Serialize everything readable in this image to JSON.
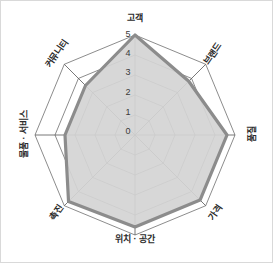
{
  "chart_data": {
    "type": "radar",
    "title": "",
    "subtitle": "",
    "xlabel": "",
    "ylabel": "",
    "categories": [
      "고객",
      "브랜드",
      "품질",
      "가격",
      "위치 · 공간",
      "촉진",
      "물품 · 서비스",
      "커뮤니티"
    ],
    "series": [
      {
        "name": "",
        "values": [
          5.0,
          3.8,
          4.6,
          4.6,
          4.6,
          4.7,
          3.5,
          3.5
        ]
      }
    ],
    "rlim": [
      0,
      5
    ],
    "tick_values": [
      0,
      1,
      2,
      3,
      4,
      5
    ],
    "tick_labels": [
      "0",
      "1",
      "2",
      "3",
      "4",
      "5"
    ],
    "grid": true,
    "grid_shape": "polygon",
    "legend": false,
    "legend_position": "none",
    "colors": {
      "fill": "#d4d4d4",
      "stroke": "#8c8c8c",
      "grid": "#6e6e6e",
      "axis": "#555555",
      "background": "#ffffff",
      "border": "#d9d9d9",
      "text": "#2b2b2b"
    }
  },
  "geometry": {
    "center_x": 134,
    "center_y": 134,
    "radius": 100,
    "axis_count": 8,
    "start_angle_deg": -90
  },
  "axis_labels": [
    {
      "text": "고객",
      "x": 134,
      "y": 18,
      "rotate": 0
    },
    {
      "text": "브랜드",
      "x": 212,
      "y": 53,
      "rotate": -55
    },
    {
      "text": "품질",
      "x": 252,
      "y": 133,
      "rotate": -90
    },
    {
      "text": "가격",
      "x": 215,
      "y": 212,
      "rotate": -55
    },
    {
      "text": "위치 · 공간",
      "x": 134,
      "y": 239,
      "rotate": 0
    },
    {
      "text": "촉진",
      "x": 56,
      "y": 212,
      "rotate": -55
    },
    {
      "text": "물품 · 서비스",
      "x": 24,
      "y": 133,
      "rotate": -90
    },
    {
      "text": "커뮤니티",
      "x": 56,
      "y": 53,
      "rotate": -55
    }
  ],
  "tick_marks": [
    {
      "label": "0",
      "x": 127,
      "y": 131
    },
    {
      "label": "1",
      "x": 127,
      "y": 112
    },
    {
      "label": "2",
      "x": 127,
      "y": 92
    },
    {
      "label": "3",
      "x": 127,
      "y": 72
    },
    {
      "label": "4",
      "x": 127,
      "y": 53
    },
    {
      "label": "5",
      "x": 127,
      "y": 34
    }
  ]
}
